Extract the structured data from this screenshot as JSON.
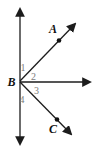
{
  "figure": {
    "background_color": "#ffffff",
    "line_color": "#1c1c1c",
    "point_label_color": "#111111",
    "angle_label_color": "#7d7d7d",
    "labels": {
      "A": "A",
      "B": "B",
      "C": "C"
    },
    "angles": {
      "a1": "1",
      "a2": "2",
      "a3": "3",
      "a4": "4"
    }
  }
}
